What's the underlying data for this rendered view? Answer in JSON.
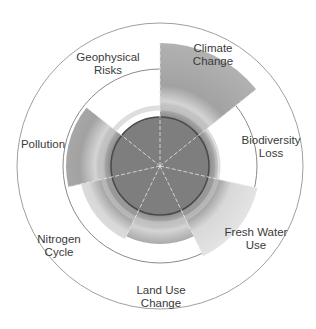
{
  "chart_data": {
    "type": "polar-area",
    "title": "",
    "center": [
      160,
      166
    ],
    "outer_ring_radius": 143,
    "boundary_ring_radius": 97,
    "inner_disk_radius": 49,
    "categories": [
      "Climate Change",
      "Biodiversity Loss",
      "Fresh Water Use",
      "Land Use Change",
      "Nitrogen Cycle",
      "Pollution",
      "Geophysical Risks"
    ],
    "values": [
      123,
      58,
      100,
      78,
      81,
      94,
      49
    ],
    "unit": "radius (px) of each segment",
    "legend": "none",
    "grid": false
  },
  "labels": [
    {
      "line1": "Climate",
      "line2": "Change",
      "x": 213,
      "y": 55
    },
    {
      "line1": "Biodiversity",
      "line2": "Loss",
      "x": 271,
      "y": 147
    },
    {
      "line1": "Fresh Water",
      "line2": "Use",
      "x": 256,
      "y": 239
    },
    {
      "line1": "Land Use",
      "line2": "Change",
      "x": 161,
      "y": 297
    },
    {
      "line1": "Nitrogen",
      "line2": "Cycle",
      "x": 59,
      "y": 246
    },
    {
      "line1": "Pollution",
      "line2": "",
      "x": 43,
      "y": 144
    },
    {
      "line1": "Geophysical",
      "line2": "Risks",
      "x": 108,
      "y": 64
    }
  ],
  "colors": {
    "wedge": "#8a8a8a",
    "wedge_light": "#cfcfcf",
    "inner_disk": "#7a7a7a",
    "inner_outline": "#444444",
    "ring": "#9a9a9a",
    "label": "#3a3a3a"
  }
}
